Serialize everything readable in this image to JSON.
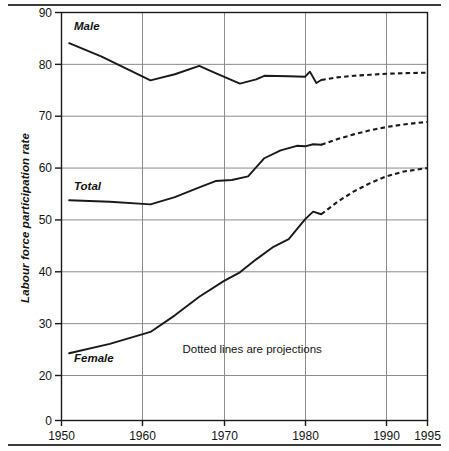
{
  "chart_data": {
    "type": "line",
    "title": "",
    "xlabel": "",
    "ylabel": "Labour force participation rate",
    "xlim": [
      1950,
      1995
    ],
    "ylim": [
      0,
      90
    ],
    "y_broken_axis": true,
    "y_break_between": [
      0,
      20
    ],
    "grid": true,
    "legend_position": "inline-labels",
    "xticks": [
      "1950",
      "1960",
      "1970",
      "1980",
      "1990",
      "1995"
    ],
    "xtick_values": [
      1950,
      1960,
      1970,
      1980,
      1990,
      1995
    ],
    "yticks": [
      "0",
      "20",
      "30",
      "40",
      "50",
      "60",
      "70",
      "80",
      "90"
    ],
    "ytick_values": [
      0,
      20,
      30,
      40,
      50,
      60,
      70,
      80,
      90
    ],
    "annotations": [
      {
        "text": "Dotted lines are projections",
        "x": 1973.5,
        "y": 24.2
      }
    ],
    "series": [
      {
        "name": "Male",
        "label": "Male",
        "label_x": 1951.6,
        "label_y": 86.6,
        "style": "solid",
        "x": [
          1951,
          1955,
          1961,
          1964,
          1967,
          1969,
          1972,
          1974,
          1975,
          1978,
          1980,
          1980.6,
          1981.4,
          1982
        ],
        "values": [
          84.0,
          81.4,
          76.8,
          78.0,
          79.6,
          78.2,
          76.2,
          77.0,
          77.7,
          77.6,
          77.5,
          78.5,
          76.3,
          76.9
        ],
        "projection": {
          "style": "dotted",
          "x": [
            1982,
            1984,
            1986,
            1988,
            1990,
            1992,
            1995
          ],
          "values": [
            76.9,
            77.4,
            77.7,
            77.9,
            78.1,
            78.2,
            78.3
          ]
        }
      },
      {
        "name": "Total",
        "label": "Total",
        "label_x": 1951.6,
        "label_y": 55.6,
        "style": "solid",
        "x": [
          1951,
          1956,
          1961,
          1964,
          1967,
          1969,
          1971,
          1973,
          1975,
          1977,
          1979,
          1980,
          1981,
          1982
        ],
        "values": [
          53.7,
          53.4,
          52.9,
          54.3,
          56.2,
          57.4,
          57.6,
          58.3,
          61.8,
          63.3,
          64.2,
          64.1,
          64.5,
          64.4
        ],
        "projection": {
          "style": "dotted",
          "x": [
            1982,
            1984,
            1986,
            1988,
            1990,
            1992,
            1995
          ],
          "values": [
            64.4,
            65.5,
            66.4,
            67.2,
            67.8,
            68.3,
            68.8
          ]
        }
      },
      {
        "name": "Female",
        "label": "Female",
        "label_x": 1951.6,
        "label_y": 22.6,
        "style": "solid",
        "x": [
          1951,
          1956,
          1961,
          1964,
          1967,
          1970,
          1972,
          1974,
          1976,
          1978,
          1980,
          1981,
          1982
        ],
        "values": [
          24.2,
          26.0,
          28.3,
          31.5,
          35.1,
          38.1,
          39.8,
          42.3,
          44.6,
          46.2,
          50.0,
          51.5,
          51.0
        ],
        "projection": {
          "style": "dotted",
          "x": [
            1982,
            1984,
            1986,
            1988,
            1990,
            1992,
            1995
          ],
          "values": [
            51.0,
            53.4,
            55.4,
            57.0,
            58.3,
            59.2,
            59.9
          ]
        }
      }
    ],
    "colors": {
      "line": "#1a1a1a",
      "grid": "#8c8c8c",
      "axis": "#1a1a1a",
      "background": "#ffffff",
      "text": "#141414"
    }
  },
  "axes": {
    "y_title": "Labour force participation rate"
  }
}
